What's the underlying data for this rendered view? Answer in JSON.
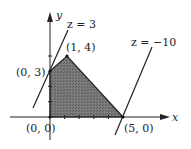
{
  "diagram": {
    "type": "linear-programming-feasible-region",
    "axes": {
      "x_label": "x",
      "y_label": "y"
    },
    "region": {
      "vertices": [
        {
          "label": "(0, 0)",
          "x": 0,
          "y": 0
        },
        {
          "label": "(0, 3)",
          "x": 0,
          "y": 3
        },
        {
          "label": "(1, 4)",
          "x": 1,
          "y": 4
        },
        {
          "label": "(5, 0)",
          "x": 5,
          "y": 0
        }
      ],
      "fill_color": "#6e6e6e"
    },
    "objective_lines": [
      {
        "label": "z = 3",
        "through": "(0, 3)"
      },
      {
        "label": "z = −10",
        "through": "(5, 0)"
      }
    ],
    "labels": {
      "v00": "(0, 0)",
      "v03": "(0, 3)",
      "v14": "(1, 4)",
      "v50": "(5, 0)",
      "z3": "z = 3",
      "zm10": "z = −10",
      "x": "x",
      "y": "y"
    }
  }
}
